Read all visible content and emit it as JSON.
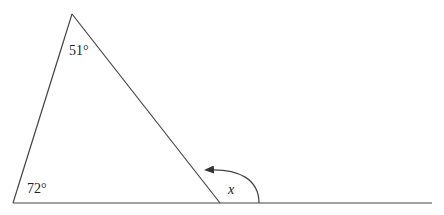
{
  "diagram": {
    "type": "geometry-triangle-exterior-angle",
    "angles": {
      "apex": "51°",
      "base_left": "72°",
      "exterior": "x"
    },
    "vertices": {
      "apex": [
        72,
        14
      ],
      "base_left": [
        13,
        203
      ],
      "base_right": [
        220,
        203
      ]
    },
    "baseline_end": [
      432,
      203
    ],
    "colors": {
      "line": "#444444",
      "text": "#222222",
      "background": "#ffffff"
    }
  }
}
